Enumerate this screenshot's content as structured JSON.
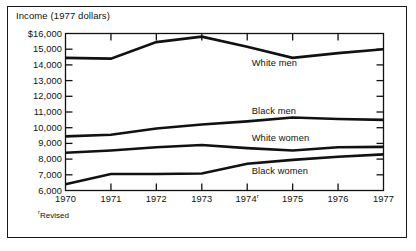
{
  "figure": {
    "axis_title": "Income (1977 dollars)",
    "footnote_marker": "r",
    "footnote_text": "Revised"
  },
  "chart_data": {
    "type": "line",
    "title": "Income (1977 dollars)",
    "xlabel": "",
    "ylabel": "Income (1977 dollars)",
    "x": [
      1970,
      1971,
      1972,
      1973,
      1974,
      1975,
      1976,
      1977
    ],
    "categories": [
      "1970",
      "1971",
      "1972",
      "1973",
      "1974",
      "1975",
      "1976",
      "1977"
    ],
    "xtick_labels": [
      "1970",
      "1971",
      "1972",
      "1973",
      "1974ʳ",
      "1975",
      "1976",
      "1977"
    ],
    "ytick_labels": [
      "$16,000",
      "15,000",
      "14,000",
      "13,000",
      "12,000",
      "11,000",
      "10,000",
      "9,000",
      "8,000",
      "7,000",
      "6,000"
    ],
    "ytick_values": [
      16000,
      15000,
      14000,
      13000,
      12000,
      11000,
      10000,
      9000,
      8000,
      7000,
      6000
    ],
    "ylim": [
      6000,
      16000
    ],
    "xlim": [
      1970,
      1977
    ],
    "grid": false,
    "legend_position": "inline-right",
    "line_color": "#111111",
    "series": [
      {
        "name": "White men",
        "label": "White men",
        "values": [
          14450,
          14400,
          15450,
          15800,
          15150,
          14450,
          14750,
          15000
        ]
      },
      {
        "name": "Black men",
        "label": "Black men",
        "values": [
          9450,
          9550,
          9950,
          10200,
          10400,
          10650,
          10550,
          10500
        ]
      },
      {
        "name": "White women",
        "label": "White women",
        "values": [
          8400,
          8550,
          8750,
          8900,
          8700,
          8550,
          8750,
          8780
        ]
      },
      {
        "name": "Black women",
        "label": "Black women",
        "values": [
          6400,
          7050,
          7050,
          7080,
          7700,
          7950,
          8150,
          8300
        ]
      }
    ],
    "annotations": [
      {
        "text": "White men",
        "x": 1974.1,
        "y": 14050
      },
      {
        "text": "Black men",
        "x": 1974.1,
        "y": 11000
      },
      {
        "text": "White women",
        "x": 1974.1,
        "y": 9250
      },
      {
        "text": "Black women",
        "x": 1974.1,
        "y": 7200
      }
    ]
  }
}
